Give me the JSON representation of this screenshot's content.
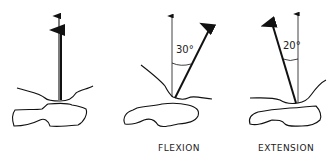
{
  "panels": [
    {
      "name": "neutral",
      "label": "",
      "angle": ""
    },
    {
      "name": "flexion",
      "label": "FLEXION",
      "angle": "30°"
    },
    {
      "name": "extension",
      "label": "EXTENSION",
      "angle": "20°"
    }
  ],
  "colors": {
    "line": "#111111",
    "background": "#ffffff"
  }
}
